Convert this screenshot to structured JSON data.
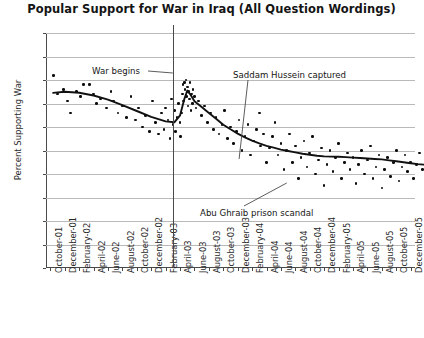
{
  "chart_data": {
    "type": "scatter",
    "title": "Popular Support for War in Iraq (All Question Wordings)",
    "xlabel": "",
    "ylabel": "Percent Supporting War",
    "ylim": [
      0,
      100
    ],
    "ytick_step": 10,
    "yticks": [
      "100",
      "90",
      "80",
      "70",
      "60",
      "50",
      "40",
      "30",
      "20",
      "10",
      "0"
    ],
    "grid": true,
    "legend": null,
    "xlim": [
      "October-01",
      "December-05"
    ],
    "categories": [
      "October-01",
      "December-01",
      "February-02",
      "April-02",
      "June-02",
      "August-02",
      "October-02",
      "December-02",
      "February-03",
      "April-03",
      "June-03",
      "August-03",
      "October-03",
      "December-03",
      "February-04",
      "April-04",
      "June-04",
      "August-04",
      "October-04",
      "December-04",
      "February-05",
      "April-05",
      "June-05",
      "August-05",
      "October-05",
      "December-05"
    ],
    "annotations": [
      {
        "name": "war-begins",
        "text": "War begins",
        "x_value": "March-03",
        "y_value": 82
      },
      {
        "name": "saddam-captured",
        "text": "Saddam Hussein captured",
        "x_value": "December-03",
        "y_value": 84
      },
      {
        "name": "abu-ghraib",
        "text": "Abu Ghraib prison scandal",
        "x_value": "May-04",
        "y_value": 24
      }
    ],
    "event_line": {
      "name": "war-begins-line",
      "x_value": "March-03"
    },
    "series": [
      {
        "name": "Poll results (individual surveys)",
        "type": "scatter",
        "marker": "filled-circle",
        "color": "#0d0d0d",
        "points": [
          [
            0.2,
            82
          ],
          [
            0.5,
            74
          ],
          [
            0.9,
            76
          ],
          [
            1.2,
            71
          ],
          [
            1.4,
            66
          ],
          [
            1.8,
            75
          ],
          [
            2.1,
            73
          ],
          [
            2.3,
            78
          ],
          [
            2.7,
            78
          ],
          [
            3.0,
            74
          ],
          [
            3.2,
            70
          ],
          [
            3.5,
            72
          ],
          [
            3.9,
            68
          ],
          [
            4.2,
            75
          ],
          [
            4.4,
            71
          ],
          [
            4.7,
            66
          ],
          [
            5.0,
            69
          ],
          [
            5.3,
            64
          ],
          [
            5.6,
            73
          ],
          [
            5.9,
            63
          ],
          [
            6.1,
            68
          ],
          [
            6.4,
            60
          ],
          [
            6.6,
            65
          ],
          [
            6.9,
            58
          ],
          [
            7.1,
            71
          ],
          [
            7.3,
            62
          ],
          [
            7.5,
            57
          ],
          [
            7.7,
            66
          ],
          [
            7.9,
            59
          ],
          [
            8.0,
            68
          ],
          [
            8.15,
            63
          ],
          [
            8.3,
            55
          ],
          [
            8.4,
            72
          ],
          [
            8.5,
            61
          ],
          [
            8.6,
            67
          ],
          [
            8.7,
            58
          ],
          [
            8.8,
            64
          ],
          [
            8.9,
            70
          ],
          [
            9.0,
            62
          ],
          [
            9.05,
            56
          ],
          [
            9.1,
            66
          ],
          [
            9.15,
            74
          ],
          [
            9.2,
            78
          ],
          [
            9.25,
            71
          ],
          [
            9.3,
            79
          ],
          [
            9.35,
            76
          ],
          [
            9.4,
            80
          ],
          [
            9.45,
            73
          ],
          [
            9.5,
            77
          ],
          [
            9.55,
            69
          ],
          [
            9.6,
            75
          ],
          [
            9.65,
            72
          ],
          [
            9.7,
            79
          ],
          [
            9.75,
            67
          ],
          [
            9.8,
            74
          ],
          [
            9.85,
            70
          ],
          [
            9.9,
            76
          ],
          [
            10.0,
            73
          ],
          [
            10.1,
            68
          ],
          [
            10.3,
            71
          ],
          [
            10.5,
            65
          ],
          [
            10.7,
            69
          ],
          [
            10.9,
            62
          ],
          [
            11.1,
            66
          ],
          [
            11.3,
            59
          ],
          [
            11.5,
            64
          ],
          [
            11.7,
            57
          ],
          [
            11.9,
            61
          ],
          [
            12.1,
            67
          ],
          [
            12.3,
            55
          ],
          [
            12.5,
            60
          ],
          [
            12.7,
            53
          ],
          [
            12.9,
            58
          ],
          [
            13.1,
            63
          ],
          [
            13.3,
            50
          ],
          [
            13.5,
            56
          ],
          [
            13.7,
            61
          ],
          [
            13.9,
            48
          ],
          [
            14.1,
            54
          ],
          [
            14.3,
            59
          ],
          [
            14.5,
            66
          ],
          [
            14.6,
            52
          ],
          [
            14.8,
            57
          ],
          [
            15.0,
            45
          ],
          [
            15.2,
            51
          ],
          [
            15.4,
            56
          ],
          [
            15.6,
            62
          ],
          [
            15.8,
            48
          ],
          [
            16.0,
            53
          ],
          [
            16.2,
            42
          ],
          [
            16.4,
            50
          ],
          [
            16.6,
            57
          ],
          [
            16.8,
            45
          ],
          [
            17.0,
            52
          ],
          [
            17.2,
            38
          ],
          [
            17.4,
            47
          ],
          [
            17.6,
            54
          ],
          [
            17.8,
            43
          ],
          [
            18.0,
            49
          ],
          [
            18.2,
            56
          ],
          [
            18.4,
            40
          ],
          [
            18.6,
            46
          ],
          [
            18.8,
            51
          ],
          [
            19.0,
            35
          ],
          [
            19.2,
            44
          ],
          [
            19.4,
            50
          ],
          [
            19.6,
            41
          ],
          [
            19.8,
            47
          ],
          [
            20.0,
            53
          ],
          [
            20.2,
            38
          ],
          [
            20.4,
            45
          ],
          [
            20.6,
            49
          ],
          [
            20.8,
            42
          ],
          [
            21.0,
            47
          ],
          [
            21.2,
            36
          ],
          [
            21.4,
            44
          ],
          [
            21.6,
            50
          ],
          [
            21.8,
            40
          ],
          [
            22.0,
            46
          ],
          [
            22.2,
            52
          ],
          [
            22.4,
            38
          ],
          [
            22.6,
            43
          ],
          [
            22.8,
            48
          ],
          [
            23.0,
            34
          ],
          [
            23.2,
            42
          ],
          [
            23.4,
            47
          ],
          [
            23.6,
            39
          ],
          [
            23.8,
            45
          ],
          [
            24.0,
            50
          ],
          [
            24.2,
            37
          ],
          [
            24.4,
            43
          ],
          [
            24.6,
            48
          ],
          [
            24.8,
            41
          ],
          [
            25.0,
            45
          ],
          [
            25.2,
            38
          ],
          [
            25.4,
            44
          ],
          [
            25.6,
            49
          ],
          [
            25.8,
            42
          ]
        ]
      },
      {
        "name": "Smoothed trend",
        "type": "line",
        "color": "#111111",
        "points": [
          [
            0.2,
            74.5
          ],
          [
            1.0,
            75.0
          ],
          [
            2.0,
            74.6
          ],
          [
            3.0,
            73.4
          ],
          [
            4.0,
            71.6
          ],
          [
            5.0,
            69.3
          ],
          [
            6.0,
            66.8
          ],
          [
            7.0,
            64.3
          ],
          [
            8.0,
            62.4
          ],
          [
            8.6,
            62.0
          ],
          [
            9.0,
            65.0
          ],
          [
            9.3,
            72.0
          ],
          [
            9.5,
            75.5
          ],
          [
            9.7,
            74.0
          ],
          [
            10.0,
            71.0
          ],
          [
            10.5,
            68.5
          ],
          [
            11.0,
            66.0
          ],
          [
            11.5,
            63.5
          ],
          [
            12.0,
            61.0
          ],
          [
            12.5,
            59.0
          ],
          [
            13.0,
            57.2
          ],
          [
            13.5,
            55.6
          ],
          [
            14.0,
            54.2
          ],
          [
            14.5,
            53.0
          ],
          [
            15.0,
            52.0
          ],
          [
            15.5,
            51.2
          ],
          [
            16.0,
            50.4
          ],
          [
            16.5,
            49.8
          ],
          [
            17.0,
            49.2
          ],
          [
            17.5,
            48.6
          ],
          [
            18.0,
            48.2
          ],
          [
            18.5,
            47.8
          ],
          [
            19.0,
            47.5
          ],
          [
            19.5,
            47.4
          ],
          [
            20.0,
            47.3
          ],
          [
            20.5,
            47.2
          ],
          [
            21.0,
            47.0
          ],
          [
            21.5,
            46.8
          ],
          [
            22.0,
            46.6
          ],
          [
            22.5,
            46.4
          ],
          [
            23.0,
            46.2
          ],
          [
            23.5,
            45.8
          ],
          [
            24.0,
            45.4
          ],
          [
            24.5,
            45.0
          ],
          [
            25.0,
            44.6
          ],
          [
            25.5,
            44.2
          ],
          [
            25.9,
            44.0
          ]
        ]
      }
    ]
  }
}
